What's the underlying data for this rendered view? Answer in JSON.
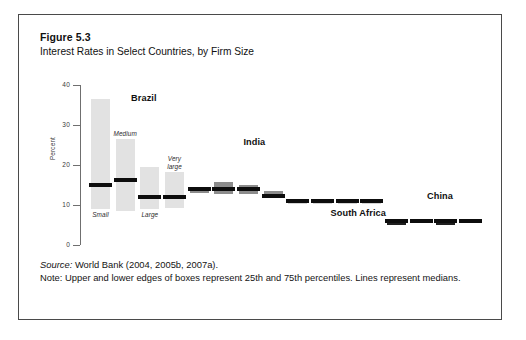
{
  "figure": {
    "number": "Figure 5.3",
    "title": "Interest Rates in Select Countries, by Firm Size"
  },
  "footer": {
    "source_label": "Source:",
    "source_text": " World Bank (2004, 2005b, 2007a).",
    "note_text": "Note: Upper and lower edges of boxes represent 25th and 75th percentiles. Lines represent medians."
  },
  "chart_data": {
    "type": "box",
    "title": "Interest Rates in Select Countries, by Firm Size",
    "xlabel": "",
    "ylabel": "Percent",
    "ylim": [
      0,
      40
    ],
    "yticks": [
      0,
      10,
      20,
      30,
      40
    ],
    "ytick_labels": [
      "0",
      "10",
      "20",
      "30",
      "40"
    ],
    "grid": false,
    "legend": "none",
    "groups": [
      {
        "name": "Brazil",
        "label_x_pct": 23.5,
        "label_y_px": 12,
        "color": "#e2e2e2",
        "boxes": [
          {
            "size_label": "Small",
            "q25": 9.0,
            "q75": 36.5,
            "median": 15.0,
            "label_pos": "below"
          },
          {
            "size_label": "Medium",
            "q25": 8.5,
            "q75": 26.5,
            "median": 16.2,
            "label_pos": "above"
          },
          {
            "size_label": "Large",
            "q25": 9.0,
            "q75": 19.5,
            "median": 12.0,
            "label_pos": "below"
          },
          {
            "size_label": "Very\nlarge",
            "q25": 9.2,
            "q75": 18.2,
            "median": 12.0,
            "label_pos": "above"
          }
        ]
      },
      {
        "name": "India",
        "label_x_pct": 48.5,
        "label_y_px": 56,
        "color": "#8c8c8c",
        "boxes": [
          {
            "size_label": "",
            "q25": 12.9,
            "q75": 14.6,
            "median": 13.9,
            "label_pos": "none"
          },
          {
            "size_label": "",
            "q25": 12.8,
            "q75": 15.7,
            "median": 14.0,
            "label_pos": "none"
          },
          {
            "size_label": "",
            "q25": 12.8,
            "q75": 15.0,
            "median": 14.0,
            "label_pos": "none"
          },
          {
            "size_label": "",
            "q25": 11.7,
            "q75": 13.6,
            "median": 12.3,
            "label_pos": "none"
          }
        ]
      },
      {
        "name": "South Africa",
        "label_x_pct": 72.0,
        "label_y_px": 127,
        "color": "#d4d4d4",
        "boxes": [
          {
            "size_label": "",
            "q25": 10.2,
            "q75": 11.4,
            "median": 11.0,
            "label_pos": "none"
          },
          {
            "size_label": "",
            "q25": 10.2,
            "q75": 11.6,
            "median": 11.1,
            "label_pos": "none"
          },
          {
            "size_label": "",
            "q25": 10.2,
            "q75": 11.6,
            "median": 11.1,
            "label_pos": "none"
          },
          {
            "size_label": "",
            "q25": 10.2,
            "q75": 11.6,
            "median": 11.1,
            "label_pos": "none"
          }
        ]
      },
      {
        "name": "China",
        "label_x_pct": 90.5,
        "label_y_px": 110,
        "color": "#1f1f1f",
        "boxes": [
          {
            "size_label": "",
            "q25": 5.0,
            "q75": 6.6,
            "median": 5.9,
            "label_pos": "none"
          },
          {
            "size_label": "",
            "q25": 5.4,
            "q75": 6.4,
            "median": 5.9,
            "label_pos": "none"
          },
          {
            "size_label": "",
            "q25": 5.0,
            "q75": 6.5,
            "median": 6.0,
            "label_pos": "none"
          },
          {
            "size_label": "",
            "q25": 5.6,
            "q75": 6.2,
            "median": 5.9,
            "label_pos": "none"
          }
        ]
      }
    ]
  }
}
